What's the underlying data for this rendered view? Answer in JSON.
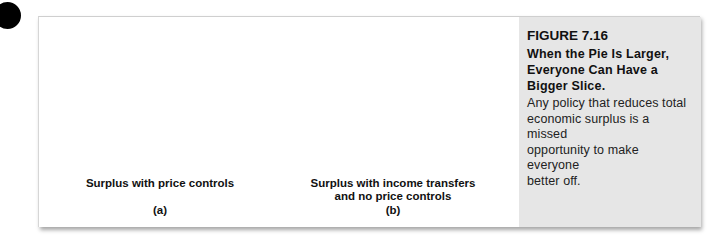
{
  "figure": {
    "number": "FIGURE 7.16",
    "title_lines": [
      "When the Pie Is Larger,",
      "Everyone Can Have a",
      "Bigger Slice."
    ],
    "body_lines": [
      "Any policy that reduces total",
      "economic surplus is a missed",
      "opportunity to make everyone",
      "better off."
    ]
  },
  "panels": [
    {
      "id": "a",
      "letter": "(a)",
      "label_lines": [
        "Surplus with price controls"
      ],
      "fill": "#d9d9d9",
      "slices": {
        "large": "R",
        "small": "P"
      }
    },
    {
      "id": "b",
      "letter": "(b)",
      "label_lines": [
        "Surplus with income transfers",
        "and no price controls"
      ],
      "fill": "#8f8f8f",
      "slices": {
        "large": "R",
        "small": "P"
      }
    }
  ],
  "colors": {
    "caption_bg": "#e6e6e6",
    "outline": "#111111"
  }
}
